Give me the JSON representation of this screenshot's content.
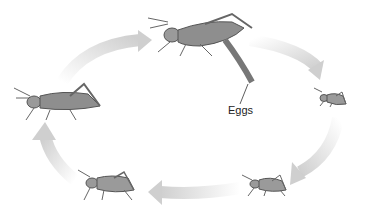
{
  "diagram": {
    "type": "life-cycle",
    "labels": {
      "eggs": "Eggs"
    },
    "stages": [
      {
        "id": "adult-laying-eggs",
        "position": "top-center"
      },
      {
        "id": "nymph-1",
        "position": "right"
      },
      {
        "id": "nymph-2",
        "position": "bottom-right"
      },
      {
        "id": "nymph-3",
        "position": "bottom-left"
      },
      {
        "id": "adult",
        "position": "left"
      }
    ],
    "arrow_color": "#d6d6d6"
  }
}
